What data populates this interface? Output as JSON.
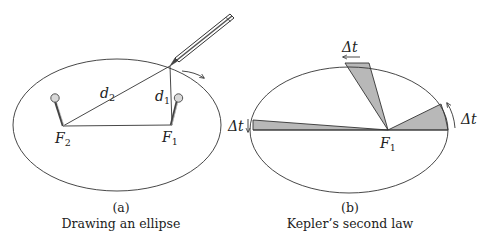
{
  "panel_a": {
    "label": "(a)",
    "caption": "Drawing an ellipse",
    "focus_left": {
      "main": "F",
      "sub": "2"
    },
    "focus_right": {
      "main": "F",
      "sub": "1"
    },
    "distance_left": {
      "main": "d",
      "sub": "2"
    },
    "distance_right": {
      "main": "d",
      "sub": "1"
    }
  },
  "panel_b": {
    "label": "(b)",
    "caption": "Kepler’s second law",
    "focus": {
      "main": "F",
      "sub": "1"
    },
    "delta_t_top": "Δt",
    "delta_t_left": "Δt",
    "delta_t_right": "Δt"
  },
  "colors": {
    "stroke": "#333333",
    "sector_fill": "#b8b8b8",
    "pin_fill": "#d8d8d8"
  }
}
